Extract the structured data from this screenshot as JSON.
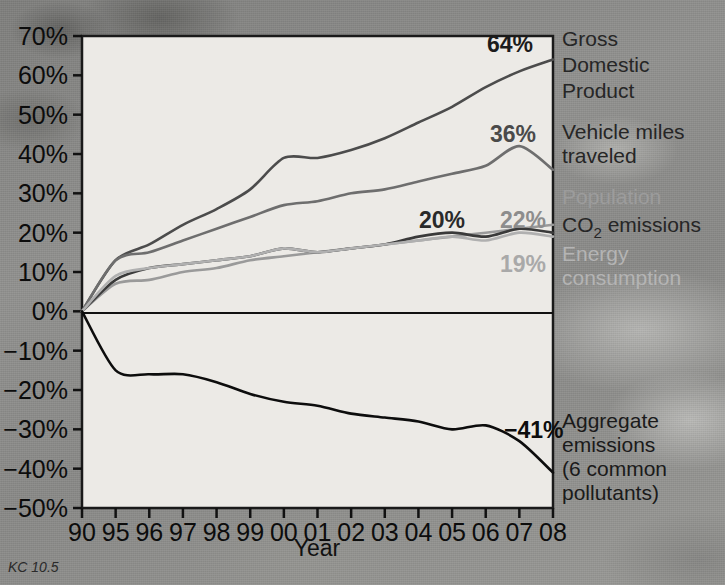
{
  "credit": "KC 10.5",
  "axes": {
    "x_title": "Year",
    "y_ticks": [
      "70%",
      "60%",
      "50%",
      "40%",
      "30%",
      "20%",
      "10%",
      "0%",
      "−10%",
      "−20%",
      "−30%",
      "−40%",
      "−50%"
    ],
    "x_ticks": [
      "90",
      "95",
      "96",
      "97",
      "98",
      "99",
      "00",
      "01",
      "02",
      "03",
      "04",
      "05",
      "06",
      "07",
      "08"
    ]
  },
  "legend": {
    "gdp": {
      "line1": "Gross",
      "line2": "Domestic",
      "line3": "Product",
      "color": "#4c4c4c"
    },
    "vmt": {
      "line1": "Vehicle miles",
      "line2": "traveled",
      "color": "#6e6e6e"
    },
    "population": {
      "line1": "Population",
      "color": "#9a9a9a"
    },
    "co2": {
      "line1": "CO",
      "sub": "2",
      "line1b": " emissions",
      "color": "#3a3a3a"
    },
    "energy": {
      "line1": "Energy",
      "line2": "consumption",
      "color": "#b0b0b0"
    },
    "aggregate": {
      "line1": "Aggregate",
      "line2": "emissions",
      "line3": "(6 common",
      "line4": "pollutants)",
      "color": "#0d0d0d"
    }
  },
  "value_labels": {
    "gdp": "64%",
    "vmt": "36%",
    "population": "22%",
    "co2": "20%",
    "energy": "19%",
    "aggregate": "−41%"
  },
  "chart_data": {
    "type": "line",
    "title": "",
    "xlabel": "Year",
    "ylabel": "",
    "xlim": [
      1990,
      2008
    ],
    "ylim": [
      -50,
      70
    ],
    "ytick_step": 10,
    "grid": false,
    "legend_position": "right-inline",
    "x": [
      1990,
      1995,
      1996,
      1997,
      1998,
      1999,
      2000,
      2001,
      2002,
      2003,
      2004,
      2005,
      2006,
      2007,
      2008
    ],
    "series": [
      {
        "name": "Gross Domestic Product",
        "color": "#4c4c4c",
        "end_label": "64%",
        "values": [
          0,
          13,
          17,
          22,
          26,
          31,
          39,
          39,
          41,
          44,
          48,
          52,
          57,
          61,
          64
        ]
      },
      {
        "name": "Vehicle miles traveled",
        "color": "#6e6e6e",
        "end_label": "36%",
        "values": [
          0,
          13,
          15,
          18,
          21,
          24,
          27,
          28,
          30,
          31,
          33,
          35,
          37,
          42,
          36
        ]
      },
      {
        "name": "Population",
        "color": "#9a9a9a",
        "end_label": "22%",
        "values": [
          0,
          7,
          8,
          10,
          11,
          13,
          14,
          15,
          16,
          17,
          18,
          19,
          20,
          21,
          22
        ]
      },
      {
        "name": "CO2 emissions",
        "color": "#3a3a3a",
        "end_label": "20%",
        "values": [
          0,
          8,
          11,
          12,
          13,
          14,
          16,
          15,
          16,
          17,
          19,
          20,
          19,
          21,
          20
        ]
      },
      {
        "name": "Energy consumption",
        "color": "#b0b0b0",
        "end_label": "19%",
        "values": [
          0,
          9,
          11,
          12,
          13,
          14,
          16,
          15,
          16,
          17,
          18,
          19,
          18,
          20,
          19
        ]
      },
      {
        "name": "Aggregate emissions (6 common pollutants)",
        "color": "#0d0d0d",
        "end_label": "−41%",
        "values": [
          0,
          -15,
          -16,
          -16,
          -18,
          -21,
          -23,
          -24,
          -26,
          -27,
          -28,
          -30,
          -29,
          -33,
          -41
        ]
      }
    ]
  }
}
